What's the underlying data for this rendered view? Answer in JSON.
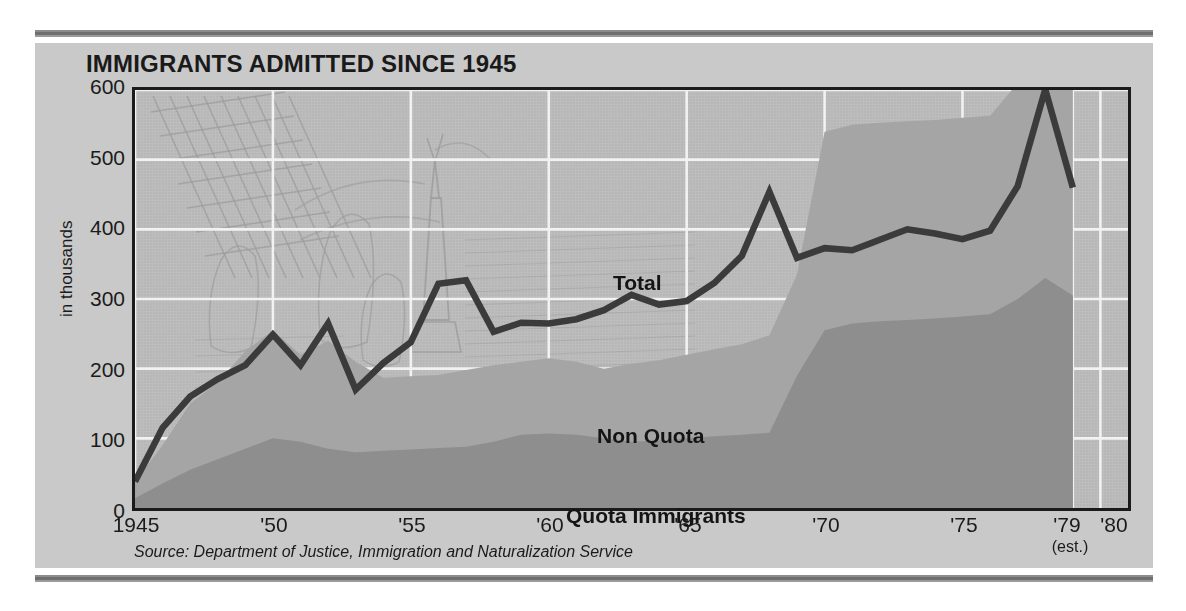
{
  "chart_title": "IMMIGRANTS ADMITTED SINCE 1945",
  "source_note": "Source: Department of Justice, Immigration and Naturalization Service",
  "axis": {
    "y_title": "in thousands",
    "y_ticks": [
      "600",
      "500",
      "400",
      "300",
      "200",
      "100",
      "0"
    ],
    "x_ticks": [
      "1945",
      "'50",
      "'55",
      "'60",
      "'65",
      "'70",
      "'75",
      "'79",
      "'80"
    ],
    "x_sub_note": "(est.)"
  },
  "annotations": {
    "total": "Total",
    "non_quota": "Non Quota",
    "quota": "Quota Immigrants"
  },
  "colors": {
    "page_background": "#ffffff",
    "card_background": "#c9c9c9",
    "plot_background": "#bdbdbd",
    "quota_area": "#8e8e8e",
    "nonquota_area": "#a5a5a5",
    "total_line": "#3b3b3b",
    "gridline": "#f2f2f2",
    "frame": "#1b1b1b",
    "rule": "#7a7a7a"
  },
  "chart_data": {
    "type": "area",
    "title": "IMMIGRANTS ADMITTED SINCE 1945",
    "subtitle": "",
    "xlabel": "",
    "ylabel": "in thousands",
    "xlim": [
      1945,
      1981
    ],
    "ylim": [
      0,
      600
    ],
    "grid": true,
    "legend_position": "inline-annotations",
    "x_tick_values": [
      1945,
      1950,
      1955,
      1960,
      1965,
      1970,
      1975,
      1979,
      1980
    ],
    "x_tick_labels": [
      "1945",
      "'50",
      "'55",
      "'60",
      "'65",
      "'70",
      "'75",
      "'79",
      "'80"
    ],
    "y_tick_values": [
      0,
      100,
      200,
      300,
      400,
      500,
      600
    ],
    "note": "1979 value is an estimate; series end at 1979",
    "x": [
      1945,
      1946,
      1947,
      1948,
      1949,
      1950,
      1951,
      1952,
      1953,
      1954,
      1955,
      1956,
      1957,
      1958,
      1959,
      1960,
      1961,
      1962,
      1963,
      1964,
      1965,
      1966,
      1967,
      1968,
      1969,
      1970,
      1971,
      1972,
      1973,
      1974,
      1975,
      1976,
      1977,
      1978,
      1979
    ],
    "series": [
      {
        "name": "Quota Immigrants",
        "stacked": true,
        "values": [
          14,
          35,
          55,
          70,
          85,
          100,
          95,
          85,
          80,
          82,
          84,
          86,
          88,
          95,
          105,
          107,
          105,
          100,
          95,
          97,
          100,
          103,
          105,
          108,
          190,
          255,
          265,
          268,
          270,
          272,
          275,
          278,
          300,
          330,
          305
        ]
      },
      {
        "name": "Non Quota",
        "stacked": true,
        "values": [
          24,
          55,
          95,
          110,
          140,
          155,
          125,
          155,
          130,
          105,
          105,
          105,
          110,
          110,
          105,
          108,
          105,
          100,
          112,
          115,
          120,
          125,
          130,
          140,
          145,
          285,
          285,
          285,
          285,
          285,
          285,
          285,
          310,
          355,
          310
        ]
      },
      {
        "name": "Total",
        "stacked": false,
        "values": [
          38,
          115,
          160,
          185,
          205,
          249,
          205,
          265,
          170,
          208,
          238,
          322,
          327,
          253,
          266,
          265,
          271,
          284,
          306,
          292,
          297,
          323,
          362,
          454,
          359,
          373,
          370,
          385,
          400,
          394,
          386,
          398,
          462,
          601,
          460
        ]
      }
    ]
  }
}
